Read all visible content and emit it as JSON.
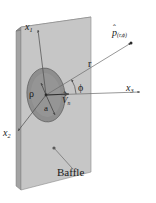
{
  "figure": {
    "caption_label": "Baffle",
    "colors": {
      "baffle_face": "#c6c6c6",
      "baffle_edge_top": "#8f8f8f",
      "baffle_edge_side": "#a3a3a3",
      "piston_face": "#8e8e8e",
      "piston_outline": "#5a5a5a",
      "line": "#4a4a4a",
      "text": "#1a1a1a",
      "background": "#ffffff"
    }
  },
  "axes": {
    "x1": {
      "label_base": "x",
      "label_sub": "1"
    },
    "x2": {
      "label_base": "x",
      "label_sub": "2"
    },
    "x3": {
      "label_base": "x",
      "label_sub": "3"
    }
  },
  "annotations": {
    "field_point": {
      "symbol": "p",
      "hat": "ˆ",
      "subscript": "(r,ϕ)"
    },
    "radial_distance": {
      "label": "r"
    },
    "polar_angle": {
      "label": "ϕ"
    },
    "normal_velocity": {
      "symbol": "V",
      "hat": "ˆ",
      "subscript": "n"
    },
    "source_coordinate": {
      "label": "ρ"
    },
    "piston_radius": {
      "label": "a"
    }
  }
}
